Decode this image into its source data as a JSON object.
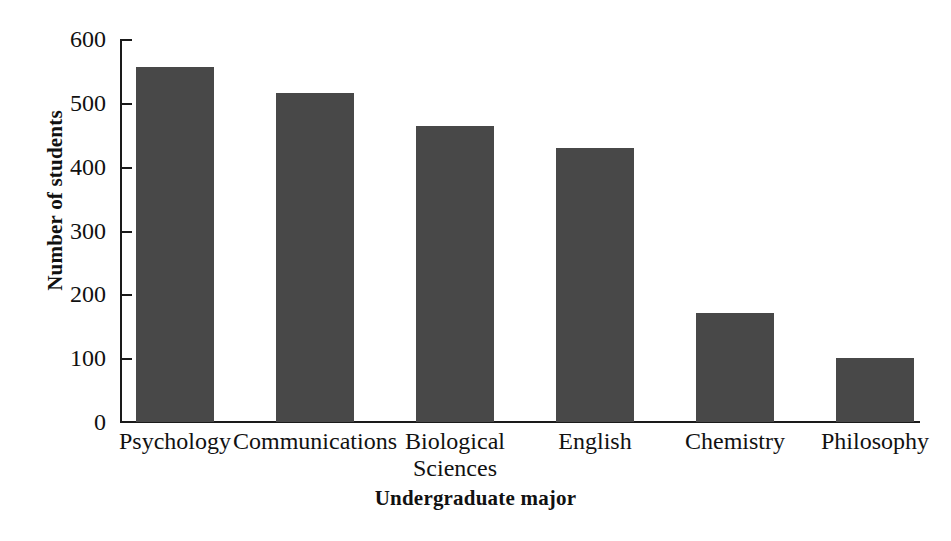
{
  "chart_data": {
    "type": "bar",
    "title": "",
    "categories": [
      "Psychology",
      "Communications",
      "Biological Sciences",
      "English",
      "Chemistry",
      "Philosophy"
    ],
    "category_display": [
      "Psychology",
      "Communications",
      "Biological\nSciences",
      "English",
      "Chemistry",
      "Philosophy"
    ],
    "values": [
      556,
      516,
      464,
      430,
      171,
      100
    ],
    "xlabel": "Undergraduate major",
    "ylabel": "Number of students",
    "ylim": [
      0,
      600
    ],
    "yticks": [
      0,
      100,
      200,
      300,
      400,
      500,
      600
    ],
    "ytick_labels": [
      "0",
      "100",
      "200",
      "300",
      "400",
      "500",
      "600"
    ],
    "grid": false,
    "legend": false,
    "bar_color": "#484848",
    "axis_color": "#1a1a1a",
    "background_color": "#ffffff"
  },
  "axes": {
    "y_title": "Number of students",
    "x_title": "Undergraduate major"
  }
}
